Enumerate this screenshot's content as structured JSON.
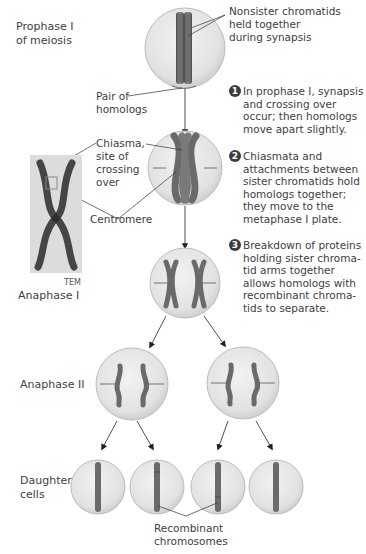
{
  "stages": {
    "prophase": "Prophase I\nof meiosis",
    "anaphase1": "Anaphase I",
    "anaphase2": "Anaphase II",
    "daughter": "Daughter\ncells"
  },
  "labels": {
    "nonsister": "Nonsister chromatids\nheld together\nduring synapsis",
    "pair": "Pair of\nhomologs",
    "chiasma": "Chiasma,\nsite of\ncrossing\nover",
    "centromere": "Centromere",
    "tem": "TEM",
    "recombinant": "Recombinant\nchromosomes"
  },
  "steps": [
    {
      "num": "1",
      "text": "In prophase I, synapsis\nand crossing over\noccur; then homologs\nmove apart slightly."
    },
    {
      "num": "2",
      "text": "Chiasmata and\nattachments between\nsister chromatids hold\nhomologs together;\nthey move to the\nmetaphase I plate."
    },
    {
      "num": "3",
      "text": "Breakdown of proteins\nholding sister chroma-\ntid arms together\nallows homologs with\nrecombinant chroma-\ntids to separate."
    }
  ],
  "colors": {
    "cell_fill": "#e4e4e4",
    "cell_edge": "#b5b5b5",
    "chromosome": "#6e6e6e",
    "chromosome_dark": "#4a4a4a",
    "number_badge": "#3d3d3d"
  }
}
